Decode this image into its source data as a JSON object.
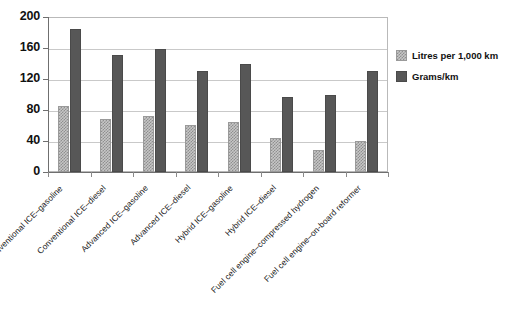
{
  "chart_data": {
    "type": "bar",
    "title": "",
    "xlabel": "",
    "ylabel": "",
    "ylim": [
      0,
      200
    ],
    "yticks": [
      0,
      40,
      80,
      120,
      160,
      200
    ],
    "grid": true,
    "legend_position": "right",
    "categories": [
      "Conventional ICE–gasoline",
      "Conventional ICE–diesel",
      "Advanced ICE–gasoline",
      "Advanced ICE–diesel",
      "Hybrid ICE–gasoline",
      "Hybrid ICE–diesel",
      "Fuel cell engine–compressed hydrogen",
      "Fuel cell engine–on-board reformer"
    ],
    "series": [
      {
        "name": "Litres per 1,000 km",
        "color": "#c6c6c6",
        "values": [
          85,
          69,
          72,
          61,
          64,
          44,
          29,
          40
        ]
      },
      {
        "name": "Grams/km",
        "color": "#575757",
        "values": [
          185,
          151,
          159,
          130,
          140,
          97,
          100,
          130
        ]
      }
    ]
  },
  "legend": {
    "items": [
      {
        "label": "Litres per 1,000 km",
        "swatch": "litres-swatch"
      },
      {
        "label": "Grams/km",
        "swatch": "grams-swatch"
      }
    ]
  },
  "axis": {
    "y_tick_labels": [
      "0",
      "40",
      "80",
      "120",
      "160",
      "200"
    ]
  }
}
